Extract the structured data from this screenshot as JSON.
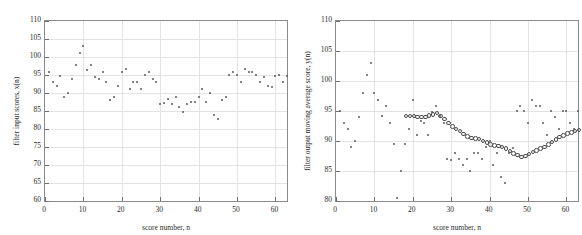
{
  "figure": {
    "panels": [
      {
        "id": "left",
        "xlabel": "score number, n",
        "ylabel": "filter input scores, x(n)"
      },
      {
        "id": "right",
        "xlabel": "score number, n",
        "ylabel": "filter output moving average score, y(n)"
      }
    ]
  },
  "chart_data": [
    {
      "type": "scatter",
      "title": "",
      "xlabel": "score number, n",
      "ylabel": "filter input scores, x(n)",
      "xlim": [
        0,
        63
      ],
      "ylim": [
        60,
        110
      ],
      "xticks": [
        0,
        10,
        20,
        30,
        40,
        50,
        60
      ],
      "yticks": [
        60,
        65,
        70,
        75,
        80,
        85,
        90,
        95,
        100,
        105,
        110
      ],
      "grid": true,
      "legend": "none",
      "marker": "dot",
      "series": [
        {
          "name": "filter input scores, x(n)",
          "x": [
            1,
            2,
            3,
            4,
            5,
            6,
            7,
            8,
            9,
            10,
            11,
            12,
            13,
            14,
            15,
            16,
            17,
            18,
            19,
            20,
            21,
            22,
            23,
            24,
            25,
            26,
            27,
            28,
            29,
            30,
            31,
            32,
            33,
            34,
            35,
            36,
            37,
            38,
            39,
            40,
            41,
            42,
            43,
            44,
            45,
            46,
            47,
            48,
            49,
            50,
            51,
            52,
            53,
            54,
            55,
            56,
            57,
            58,
            59,
            60,
            61,
            62,
            63
          ],
          "values": [
            95.8,
            93.0,
            92.0,
            94.8,
            89.0,
            90.0,
            94.0,
            97.8,
            101.0,
            103.0,
            96.5,
            97.7,
            94.5,
            94.0,
            95.8,
            93.0,
            88.0,
            89.0,
            92.0,
            95.8,
            96.8,
            91.0,
            93.0,
            93.0,
            91.0,
            95.0,
            95.8,
            94.0,
            93.0,
            87.0,
            87.2,
            88.2,
            87.0,
            89.0,
            86.0,
            84.8,
            87.0,
            87.5,
            87.5,
            89.0,
            91.0,
            87.5,
            90.0,
            84.0,
            82.7,
            88.0,
            88.8,
            95.0,
            95.8,
            95.0,
            93.0,
            96.8,
            95.8,
            95.8,
            95.0,
            93.0,
            94.5,
            92.0,
            91.8,
            94.8,
            95.0,
            93.0,
            94.8
          ]
        }
      ]
    },
    {
      "type": "scatter",
      "title": "",
      "xlabel": "score number, n",
      "ylabel": "filter output moving average score, y(n)",
      "xlim": [
        0,
        63
      ],
      "ylim": [
        80,
        110
      ],
      "xticks": [
        0,
        10,
        20,
        30,
        40,
        50,
        60
      ],
      "yticks": [
        80,
        85,
        90,
        95,
        100,
        105,
        110
      ],
      "grid": true,
      "legend": "none",
      "marker": "dot+ring",
      "series": [
        {
          "name": "filter input scores, x(n)",
          "marker": "dot",
          "x": [
            1,
            2,
            3,
            4,
            5,
            6,
            7,
            8,
            9,
            10,
            11,
            12,
            13,
            14,
            15,
            16,
            17,
            18,
            19,
            20,
            21,
            22,
            23,
            24,
            25,
            26,
            27,
            28,
            29,
            30,
            31,
            32,
            33,
            34,
            35,
            36,
            37,
            38,
            39,
            40,
            41,
            42,
            43,
            44,
            45,
            46,
            47,
            48,
            49,
            50,
            51,
            52,
            53,
            54,
            55,
            56,
            57,
            58,
            59,
            60,
            61,
            62,
            63
          ],
          "values": [
            95.0,
            93.0,
            92.0,
            89.0,
            90.0,
            94.0,
            98.0,
            101.0,
            103.0,
            98.0,
            96.8,
            94.2,
            95.8,
            93.0,
            89.5,
            80.5,
            85.0,
            89.5,
            92.0,
            96.8,
            91.0,
            93.3,
            93.0,
            91.0,
            94.8,
            95.8,
            94.2,
            93.0,
            87.0,
            86.8,
            88.0,
            87.0,
            86.0,
            87.0,
            85.0,
            88.0,
            88.0,
            87.0,
            89.0,
            90.0,
            86.0,
            88.0,
            84.0,
            83.0,
            88.0,
            88.8,
            95.0,
            95.8,
            95.0,
            93.0,
            96.8,
            95.8,
            95.8,
            93.0,
            91.0,
            95.0,
            94.0,
            92.0,
            95.0,
            95.0,
            93.0,
            92.0,
            95.0
          ]
        },
        {
          "name": "filter output moving average score, y(n)",
          "marker": "ring",
          "x": [
            18,
            19,
            20,
            21,
            22,
            23,
            24,
            25,
            26,
            27,
            28,
            29,
            30,
            31,
            32,
            33,
            34,
            35,
            36,
            37,
            38,
            39,
            40,
            41,
            42,
            43,
            44,
            45,
            46,
            47,
            48,
            49,
            50,
            51,
            52,
            53,
            54,
            55,
            56,
            57,
            58,
            59,
            60,
            61,
            62,
            63
          ],
          "values": [
            94.3,
            94.3,
            94.3,
            94.2,
            94.2,
            94.2,
            94.4,
            94.6,
            94.8,
            94.3,
            93.8,
            93.2,
            92.6,
            92.2,
            91.8,
            91.3,
            90.9,
            90.7,
            90.6,
            90.5,
            90.2,
            89.9,
            89.6,
            89.4,
            89.3,
            89.2,
            88.9,
            88.5,
            88.1,
            87.8,
            87.5,
            87.7,
            88.0,
            88.3,
            88.6,
            88.9,
            89.2,
            89.6,
            90.0,
            90.4,
            90.8,
            91.1,
            91.4,
            91.6,
            91.8,
            92.0
          ]
        }
      ]
    }
  ]
}
